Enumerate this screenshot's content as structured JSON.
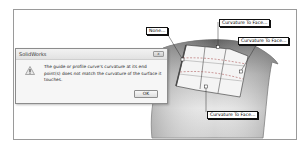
{
  "dialog": {
    "title": "SolidWorks",
    "close_label": "x",
    "icon": "warning-icon",
    "message": "The guide or profile curve's curvature at its end point(s) does not match the curvature of the surface it touches.",
    "ok_label": "OK"
  },
  "callouts": {
    "none": "None...",
    "top": "Curvature To Face...",
    "right": "Curvature To Face...",
    "bottom": "Curvature To Face..."
  },
  "colors": {
    "surface_dark": "#6f6f6f",
    "surface_light": "#d8d8d8",
    "patch": "#f2f2f2",
    "curve_dashed": "#a04040"
  }
}
